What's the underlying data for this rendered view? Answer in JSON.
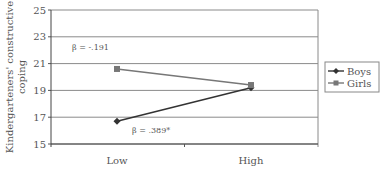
{
  "chart_data": {
    "type": "line",
    "title": "",
    "xlabel": "",
    "ylabel": "Kindergarteners' constructive coping",
    "ylabel_lines": [
      "Kindergarteners' constructive",
      "coping"
    ],
    "categories": [
      "Low",
      "High"
    ],
    "ylim": [
      15,
      25
    ],
    "yticks": [
      15,
      17,
      19,
      21,
      23,
      25
    ],
    "grid": true,
    "legend_position": "right",
    "series": [
      {
        "name": "Boys",
        "values": [
          16.7,
          19.2
        ],
        "marker": "diamond",
        "color": "#333333"
      },
      {
        "name": "Girls",
        "values": [
          20.6,
          19.4
        ],
        "marker": "square",
        "color": "#777777"
      }
    ],
    "annotations": [
      {
        "text": "β = -.191",
        "near": "Girls, Low"
      },
      {
        "text": "β = .389*",
        "near": "Boys, Low"
      }
    ]
  },
  "legend": {
    "items": [
      {
        "label": "Boys"
      },
      {
        "label": "Girls"
      }
    ]
  }
}
